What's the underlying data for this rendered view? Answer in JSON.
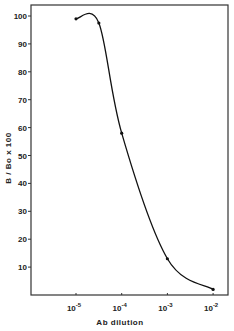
{
  "chart_data": {
    "type": "line",
    "title": "",
    "xlabel": "Ab dilution",
    "ylabel": "B / Bo x 100",
    "x_scale": "log",
    "x_ticks": [
      {
        "base": "10",
        "exp": "-5",
        "value": 1e-05
      },
      {
        "base": "10",
        "exp": "-4",
        "value": 0.0001
      },
      {
        "base": "10",
        "exp": "-3",
        "value": 0.001
      },
      {
        "base": "10",
        "exp": "-2",
        "value": 0.01
      }
    ],
    "y_ticks": [
      10,
      20,
      30,
      40,
      50,
      60,
      70,
      80,
      90,
      100
    ],
    "ylim": [
      0,
      105
    ],
    "xlim_log10": [
      -5.95,
      -1.7
    ],
    "grid": false,
    "legend": null,
    "series": [
      {
        "name": "B/Bo x 100",
        "x_log10": [
          -5.0,
          -4.5,
          -4.0,
          -3.0,
          -2.0
        ],
        "x": [
          1e-05,
          3.16e-05,
          0.0001,
          0.001,
          0.01
        ],
        "y": [
          99,
          97.5,
          58,
          13,
          2
        ]
      }
    ],
    "colors": {
      "line": "#111111",
      "axis": "#333333",
      "background": "#ffffff"
    }
  }
}
